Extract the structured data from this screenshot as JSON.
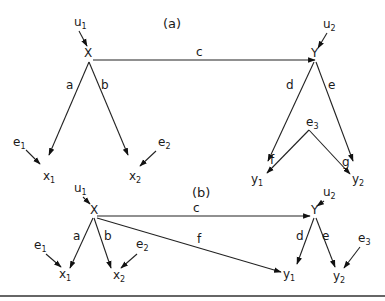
{
  "diagram": {
    "panels": [
      {
        "id": "a",
        "title": "(a)",
        "nodes": {
          "X": "X",
          "Y": "Y",
          "u1": "u",
          "u1_sub": "1",
          "u2": "u",
          "u2_sub": "2",
          "x1": "x",
          "x1_sub": "1",
          "x2": "x",
          "x2_sub": "2",
          "y1": "y",
          "y1_sub": "1",
          "y2": "y",
          "y2_sub": "2",
          "e1": "e",
          "e1_sub": "1",
          "e2": "e",
          "e2_sub": "2",
          "e3": "e",
          "e3_sub": "3"
        },
        "edge_labels": {
          "a": "a",
          "b": "b",
          "c": "c",
          "d": "d",
          "e": "e",
          "f": "f",
          "g": "g"
        },
        "edges": [
          {
            "from": "u1",
            "to": "X"
          },
          {
            "from": "u2",
            "to": "Y"
          },
          {
            "from": "X",
            "to": "Y",
            "label": "c"
          },
          {
            "from": "X",
            "to": "x1",
            "label": "a"
          },
          {
            "from": "X",
            "to": "x2",
            "label": "b"
          },
          {
            "from": "Y",
            "to": "y1",
            "label": "d"
          },
          {
            "from": "Y",
            "to": "y2",
            "label": "e"
          },
          {
            "from": "e1",
            "to": "x1"
          },
          {
            "from": "e2",
            "to": "x2"
          },
          {
            "from": "e3",
            "to": "y1",
            "label": "f"
          },
          {
            "from": "e3",
            "to": "y2",
            "label": "g"
          }
        ]
      },
      {
        "id": "b",
        "title": "(b)",
        "nodes": {
          "X": "X",
          "Y": "Y",
          "u1": "u",
          "u1_sub": "1",
          "u2": "u",
          "u2_sub": "2",
          "x1": "x",
          "x1_sub": "1",
          "x2": "x",
          "x2_sub": "2",
          "y1": "y",
          "y1_sub": "1",
          "y2": "y",
          "y2_sub": "2",
          "e1": "e",
          "e1_sub": "1",
          "e2": "e",
          "e2_sub": "2",
          "e3": "e",
          "e3_sub": "3"
        },
        "edge_labels": {
          "a": "a",
          "b": "b",
          "c": "c",
          "d": "d",
          "e": "e",
          "f": "f"
        },
        "edges": [
          {
            "from": "u1",
            "to": "X"
          },
          {
            "from": "u2",
            "to": "Y"
          },
          {
            "from": "X",
            "to": "Y",
            "label": "c"
          },
          {
            "from": "X",
            "to": "x1",
            "label": "a"
          },
          {
            "from": "X",
            "to": "x2",
            "label": "b"
          },
          {
            "from": "X",
            "to": "y1",
            "label": "f"
          },
          {
            "from": "Y",
            "to": "y1",
            "label": "d"
          },
          {
            "from": "Y",
            "to": "y2",
            "label": "e"
          },
          {
            "from": "e1",
            "to": "x1"
          },
          {
            "from": "e2",
            "to": "x2"
          },
          {
            "from": "e3",
            "to": "y2"
          }
        ]
      }
    ]
  }
}
